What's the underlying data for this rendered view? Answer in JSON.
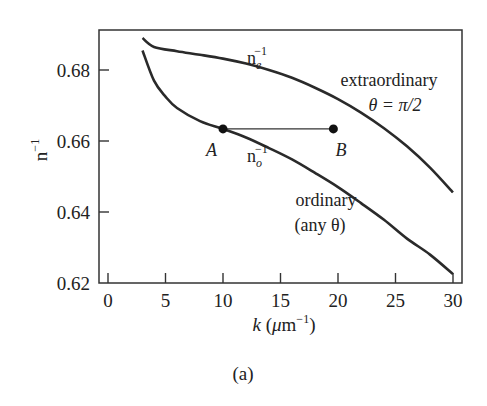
{
  "chart_data": {
    "type": "line",
    "title": "",
    "caption": "(a)",
    "xlabel": "k (μm⁻¹)",
    "xlabel_parts": {
      "var": "k",
      "unit_open": "(",
      "mu": "μ",
      "unit": "m",
      "sup": "−1",
      "unit_close": ")"
    },
    "ylabel": "n⁻¹",
    "ylabel_parts": {
      "base": "n",
      "sup": "−1"
    },
    "xlim": [
      -0.5,
      31
    ],
    "ylim": [
      0.62,
      0.69
    ],
    "x_ticks": [
      0,
      5,
      10,
      15,
      20,
      25,
      30
    ],
    "x_tick_labels": [
      "0",
      "5",
      "10",
      "15",
      "20",
      "25",
      "30"
    ],
    "y_ticks": [
      0.62,
      0.64,
      0.66,
      0.68
    ],
    "y_tick_labels": [
      "0.62",
      "0.64",
      "0.66",
      "0.68"
    ],
    "grid": false,
    "legend": "none (inline annotations)",
    "series": [
      {
        "name": "extraordinary θ = π/2 (n_e⁻¹)",
        "x": [
          3,
          4,
          6,
          8,
          10,
          12,
          14,
          16,
          18,
          20,
          22,
          24,
          26,
          28,
          30
        ],
        "values": [
          0.689,
          0.6865,
          0.6853,
          0.6843,
          0.6832,
          0.6818,
          0.68,
          0.6778,
          0.675,
          0.6718,
          0.668,
          0.6636,
          0.6585,
          0.6525,
          0.6455
        ]
      },
      {
        "name": "ordinary any θ (n_o⁻¹)",
        "x": [
          3,
          4,
          5,
          6,
          8,
          10,
          12,
          14,
          16,
          18,
          20,
          22,
          24,
          26,
          28,
          30
        ],
        "values": [
          0.6855,
          0.677,
          0.6725,
          0.6693,
          0.6656,
          0.6634,
          0.661,
          0.658,
          0.6548,
          0.651,
          0.647,
          0.6425,
          0.6378,
          0.6325,
          0.628,
          0.6225
        ]
      }
    ],
    "points": [
      {
        "label": "A",
        "x": 10,
        "y": 0.6634
      },
      {
        "label": "B",
        "x": 19.6,
        "y": 0.6634
      }
    ],
    "annotations": {
      "ne_label": {
        "base": "n",
        "sub": "e",
        "sup": "−1"
      },
      "no_label": {
        "base": "n",
        "sub": "o",
        "sup": "−1"
      },
      "extraordinary_line1": "extraordinary",
      "extraordinary_line2": "θ = π/2",
      "ordinary_line1": "ordinary",
      "ordinary_line2": "(any θ)"
    }
  }
}
